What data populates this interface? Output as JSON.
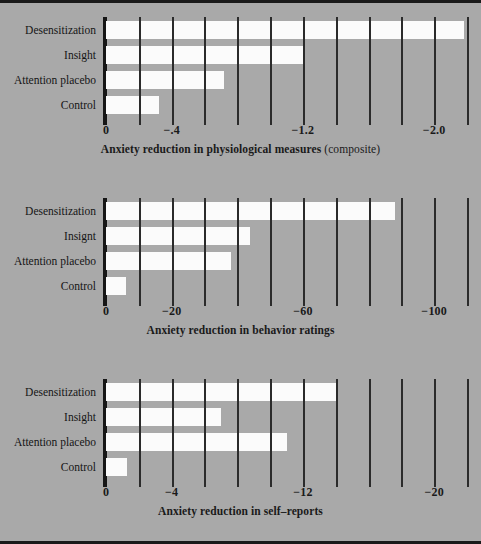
{
  "figure": {
    "background_color": "#a9a9a9",
    "bar_color": "#fbfbfb",
    "grid_color": "#2b2b2b",
    "axis_color": "#161616"
  },
  "chart_data": [
    {
      "type": "bar",
      "orientation": "horizontal",
      "title": "",
      "caption_main": "Anxiety reduction in physiological measures",
      "caption_soft": "(composite)",
      "xlabel": "Anxiety reduction in physiological measures (composite)",
      "ylabel": "",
      "categories": [
        "Desensitization",
        "Insight",
        "Attention placebo",
        "Control"
      ],
      "values": [
        -2.18,
        -1.2,
        -0.72,
        -0.32
      ],
      "xlim": [
        0,
        -2.2
      ],
      "grid": true,
      "grid_step": 0.2,
      "tick_positions": [
        0,
        -0.4,
        -1.2,
        -2.0
      ],
      "tick_labels": [
        "0",
        "−.4",
        "−1.2",
        "−2.0"
      ],
      "legend": "none"
    },
    {
      "type": "bar",
      "orientation": "horizontal",
      "title": "",
      "caption_main": "Anxiety reduction in behavior ratings",
      "caption_soft": "",
      "xlabel": "Anxiety reduction in behavior ratings",
      "ylabel": "",
      "categories": [
        "Desensitization",
        "Insignt",
        "Attention placebo",
        "Control"
      ],
      "values": [
        -88,
        -44,
        -38,
        -6
      ],
      "xlim": [
        0,
        -110
      ],
      "grid": true,
      "grid_step": 10,
      "tick_positions": [
        0,
        -20,
        -60,
        -100
      ],
      "tick_labels": [
        "0",
        "−20",
        "−60",
        "−100"
      ],
      "legend": "none"
    },
    {
      "type": "bar",
      "orientation": "horizontal",
      "title": "",
      "caption_main": "Anxiety reduction in self–reports",
      "caption_soft": "",
      "xlabel": "Anxiety reduction in self-reports",
      "ylabel": "",
      "categories": [
        "Desensitization",
        "Insight",
        "Attention placebo",
        "Control"
      ],
      "values": [
        -14.0,
        -7.0,
        -11.0,
        -1.3
      ],
      "xlim": [
        0,
        -22
      ],
      "grid": true,
      "grid_step": 2,
      "tick_positions": [
        0,
        -4,
        -12,
        -20
      ],
      "tick_labels": [
        "0",
        "−4",
        "−12",
        "−20"
      ],
      "legend": "none"
    }
  ]
}
